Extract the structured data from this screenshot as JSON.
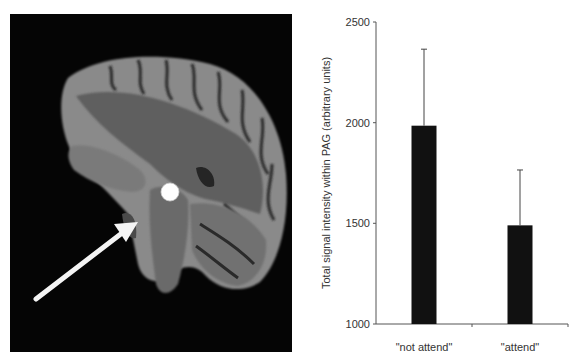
{
  "figure": {
    "left_panel": {
      "description": "Sagittal MRI brain slice with white circle marking PAG and white arrow pointing to it",
      "background": "#050505",
      "marker": {
        "type": "circle",
        "color": "#ffffff"
      },
      "arrow": {
        "color": "#ffffff"
      }
    }
  },
  "chart_data": {
    "type": "bar",
    "title": "",
    "xlabel": "",
    "ylabel": "Total signal intensity within PAG (arbitrary units)",
    "categories": [
      "\"not attend\"",
      "\"attend\""
    ],
    "values": [
      1985,
      1490
    ],
    "error_upper": [
      2365,
      1765
    ],
    "ylim": [
      1000,
      2500
    ],
    "yticks": [
      1000,
      1500,
      2000,
      2500
    ],
    "ytick_labels": [
      "1000",
      "1500",
      "2000",
      "2500"
    ],
    "bar_color": "#111111",
    "grid": false,
    "legend": null
  }
}
